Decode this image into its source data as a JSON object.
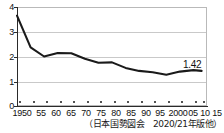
{
  "chart_data": {
    "type": "line",
    "title": "",
    "subtitle": "",
    "xlabel": "年",
    "ylabel": "",
    "ylim": [
      0,
      4
    ],
    "yticks": [
      0,
      1,
      2,
      3,
      4
    ],
    "ytick_labels": [
      "0",
      "1",
      "2",
      "3",
      "4"
    ],
    "grid": true,
    "gridlines_at": [
      1,
      2,
      3
    ],
    "legend": "none",
    "x": [
      1950,
      1955,
      1960,
      1965,
      1970,
      1975,
      1980,
      1985,
      1990,
      1995,
      2000,
      2005,
      2010,
      2015,
      2018
    ],
    "xtick_labels": [
      "1950",
      "55",
      "60",
      "65",
      "70",
      "75",
      "80",
      "85",
      "90",
      "95",
      "2000",
      "05",
      "10",
      "15",
      "18年"
    ],
    "values": [
      3.65,
      2.37,
      2.0,
      2.14,
      2.13,
      1.91,
      1.75,
      1.76,
      1.54,
      1.42,
      1.36,
      1.26,
      1.39,
      1.45,
      1.42
    ],
    "annotations": [
      {
        "name": "last-value",
        "text": "1.42",
        "x": 2018,
        "y": 1.42
      }
    ],
    "source": "（日本国勢図会　2020/21年版他）"
  },
  "axis": {
    "y_labels": [
      "4",
      "3",
      "2",
      "1",
      "0"
    ],
    "x_labels": [
      "1950",
      "55",
      "60",
      "65",
      "70",
      "75",
      "80",
      "85",
      "90",
      "95",
      "2000",
      "05",
      "10",
      "15",
      "18年"
    ]
  },
  "annotation": {
    "last_value": "1.42"
  },
  "source": {
    "text": "（日本国勢図会　2020/21年版他）"
  },
  "colors": {
    "line": "#1a1a1a",
    "grid": "#c9c9c9",
    "axis": "#2a2a2a",
    "frame": "#b9b9b9",
    "background": "#ffffff"
  }
}
